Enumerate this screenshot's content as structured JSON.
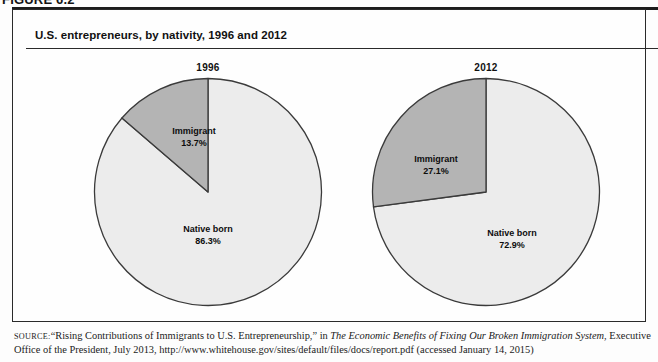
{
  "figure": {
    "label": "FIGURE 6.2",
    "title": "U.S. entrepreneurs, by nativity, 1996 and 2012"
  },
  "source": {
    "label": "Source:",
    "text_part1": "“Rising Contributions of Immigrants to U.S. Entrepreneurship,” in ",
    "italic_title": "The Economic Benefits of Fixing Our Broken Immigration System",
    "text_part2": ", Executive Office of the President, July 2013, http://www.whitehouse.gov/sites/default/files/docs/report.pdf (accessed January 14, 2015)"
  },
  "colors": {
    "immigrant_fill": "#b4b4b4",
    "native_fill": "#ececec",
    "outline": "#3a3a3a",
    "text": "#111111"
  },
  "chart_data": [
    {
      "type": "pie",
      "title": "1996",
      "labels": [
        "Immigrant",
        "Native born"
      ],
      "values": [
        13.7,
        86.3
      ],
      "value_labels": [
        "13.7%",
        "86.3%"
      ],
      "units": "percent",
      "start_angle_deg": 90,
      "direction": "counterclockwise",
      "legend": "none",
      "slice_colors": [
        "#b4b4b4",
        "#ececec"
      ]
    },
    {
      "type": "pie",
      "title": "2012",
      "labels": [
        "Immigrant",
        "Native born"
      ],
      "values": [
        27.1,
        72.9
      ],
      "value_labels": [
        "27.1%",
        "72.9%"
      ],
      "units": "percent",
      "start_angle_deg": 90,
      "direction": "counterclockwise",
      "legend": "none",
      "slice_colors": [
        "#b4b4b4",
        "#ececec"
      ]
    }
  ]
}
